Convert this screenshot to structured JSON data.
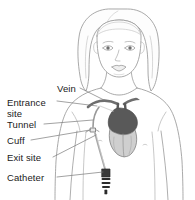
{
  "figure": {
    "background_color": "#ffffff",
    "line_color": "#8c8c8c",
    "label_color": "#1a1a1a",
    "heart_color": "#5a5a5a",
    "vein_color": "#6e6e6e",
    "catheter_color": "#9a9a9a",
    "connector_color": "#2b2b2b"
  },
  "labels": {
    "vein": "Vein",
    "entrance_site": "Entrance\nsite",
    "tunnel": "Tunnel",
    "cuff": "Cuff",
    "exit_site": "Exit site",
    "catheter": "Catheter"
  },
  "subject": {
    "description": "Front view of a child's head, neck, chest and arms",
    "hair_style": "chin-length bob"
  }
}
